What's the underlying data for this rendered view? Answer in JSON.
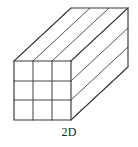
{
  "figure": {
    "caption": "2D",
    "shape_type": "cuboid",
    "colors": {
      "background": "#ffffff",
      "edge_stroke": "#3a3a3a",
      "grid_stroke": "#4a4a4a",
      "depth_stroke": "#555555",
      "face_fill": "#ffffff",
      "caption_color": "#1c1c1c"
    },
    "geometry": {
      "front_face": {
        "left": 14,
        "top": 61,
        "right": 71,
        "bottom": 120,
        "columns": 3,
        "rows": 3
      },
      "depth_offset": {
        "dx": 57,
        "dy": -53
      },
      "vertices": {
        "front_top_left": [
          14,
          61
        ],
        "front_top_right": [
          71,
          61
        ],
        "front_bottom_left": [
          14,
          120
        ],
        "front_bottom_right": [
          71,
          120
        ],
        "back_top_left": [
          71,
          8
        ],
        "back_top_right": [
          128,
          8
        ],
        "back_bottom_right": [
          128,
          67
        ]
      },
      "front_vertical_divider_x": [
        33,
        52
      ],
      "front_horizontal_divider_y": [
        81,
        100
      ]
    },
    "counts": {
      "front_grid_cells": 9,
      "top_face_depth_lines": 3,
      "right_face_depth_lines": 3
    }
  }
}
